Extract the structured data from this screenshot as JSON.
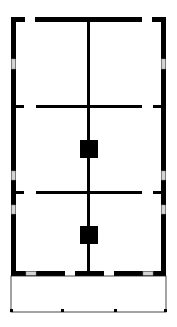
{
  "diagram": {
    "type": "floor-plan",
    "colors": {
      "wall": "#000000",
      "background": "#ffffff",
      "window": "#cfcfcf",
      "porch_line": "#1a1a1a"
    },
    "rooms": [
      {
        "id": "room-top-left"
      },
      {
        "id": "room-top-right"
      },
      {
        "id": "room-middle-left"
      },
      {
        "id": "room-middle-right"
      },
      {
        "id": "room-bottom-left"
      },
      {
        "id": "room-bottom-right"
      },
      {
        "id": "porch"
      }
    ],
    "pillars": 2,
    "windows": 8
  }
}
